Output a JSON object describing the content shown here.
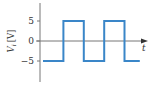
{
  "chart_data": {
    "type": "line",
    "title": "",
    "xlabel": "t",
    "ylabel": "V",
    "ylabel_subscript": "i",
    "ylabel_unit": "[V]",
    "yticks": [
      5,
      0,
      -5
    ],
    "ytick_labels": [
      "5",
      "0",
      "−5"
    ],
    "ylim": [
      -10,
      10
    ],
    "xlim": [
      0,
      5.2
    ],
    "grid": false,
    "legend": "none",
    "line_color": "#3a86c8",
    "axis_color": "#777777",
    "series": [
      {
        "name": "V_i",
        "step": true,
        "x": [
          0,
          1,
          1,
          2,
          2,
          3,
          3,
          4,
          4,
          4.75
        ],
        "y": [
          -5,
          -5,
          5,
          5,
          -5,
          -5,
          5,
          5,
          -5,
          -5
        ]
      }
    ]
  }
}
